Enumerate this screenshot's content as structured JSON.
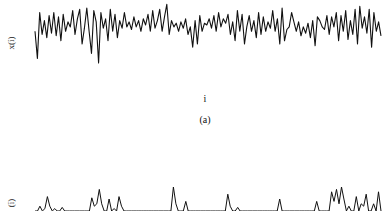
{
  "chart_data": [
    {
      "type": "line",
      "title": "",
      "caption": "(a)",
      "xlabel": "i",
      "ylabel": "x(i)",
      "grid": false,
      "legend": null,
      "note": "Noisy fluctuating time series; no tick labels visible. Values are normalized pixel-estimated amplitudes (0=bottom, 1=top of trace band).",
      "x_range_px": [
        35,
        381
      ],
      "values": [
        0.55,
        0.12,
        0.85,
        0.5,
        0.72,
        0.45,
        0.8,
        0.52,
        0.85,
        0.48,
        0.78,
        0.4,
        0.82,
        0.55,
        0.7,
        0.62,
        0.88,
        0.5,
        0.75,
        0.9,
        0.35,
        0.6,
        0.92,
        0.55,
        0.2,
        0.88,
        0.7,
        0.05,
        0.85,
        0.6,
        0.75,
        0.4,
        0.9,
        0.55,
        0.82,
        0.45,
        0.72,
        0.6,
        0.85,
        0.62,
        0.7,
        0.58,
        0.78,
        0.62,
        0.72,
        0.55,
        0.75,
        0.65,
        0.82,
        0.55,
        0.88,
        0.6,
        0.72,
        0.9,
        0.55,
        0.78,
        0.98,
        0.5,
        0.72,
        0.62,
        0.68,
        0.55,
        0.7,
        0.6,
        0.75,
        0.5,
        0.62,
        0.3,
        0.72,
        0.35,
        0.8,
        0.55,
        0.68,
        0.65,
        0.75,
        0.6,
        0.8,
        0.55,
        0.85,
        0.62,
        0.75,
        0.68,
        0.82,
        0.5,
        0.7,
        0.4,
        0.88,
        0.55,
        0.82,
        0.35,
        0.62,
        0.8,
        0.55,
        0.72,
        0.45,
        0.85,
        0.5,
        0.78,
        0.55,
        0.7,
        0.6,
        0.88,
        0.55,
        0.75,
        0.35,
        0.92,
        0.4,
        0.58,
        0.62,
        0.85,
        0.7,
        0.55,
        0.7,
        0.48,
        0.62,
        0.52,
        0.68,
        0.45,
        0.72,
        0.32,
        0.78,
        0.72,
        0.62,
        0.58,
        0.8,
        0.5,
        0.78,
        0.62,
        0.85,
        0.4,
        0.8,
        0.55,
        0.88,
        0.42,
        0.72,
        0.5,
        0.9,
        0.35,
        0.95,
        0.6,
        0.78,
        0.52,
        0.9,
        0.3,
        0.85,
        0.55,
        0.7,
        0.48
      ]
    },
    {
      "type": "line",
      "title": "",
      "caption": "",
      "xlabel": "",
      "ylabel": "(i)",
      "grid": false,
      "legend": null,
      "note": "Second panel partially cut off at bottom; sparse positive spikes above baseline. Values are normalized spike heights.",
      "x_range_px": [
        35,
        381
      ],
      "values": [
        0,
        0,
        0.2,
        0,
        0.1,
        0.6,
        0.2,
        0,
        0.1,
        0,
        0,
        0.15,
        0,
        0,
        0,
        0,
        0,
        0,
        0,
        0,
        0,
        0,
        0,
        0.55,
        0.2,
        0.3,
        0.9,
        0.3,
        0,
        0,
        0.5,
        0,
        0.1,
        0,
        0.6,
        0.2,
        0,
        0,
        0,
        0,
        0,
        0,
        0,
        0,
        0,
        0,
        0,
        0,
        0,
        0,
        0,
        0,
        0,
        0,
        0,
        0,
        1.0,
        0.3,
        0,
        0,
        0,
        0.4,
        0,
        0,
        0,
        0,
        0,
        0,
        0,
        0,
        0,
        0,
        0,
        0,
        0,
        0,
        0,
        0,
        0.7,
        0.2,
        0,
        0,
        0.15,
        0,
        0,
        0,
        0,
        0,
        0,
        0,
        0,
        0,
        0,
        0,
        0,
        0,
        0,
        0,
        0,
        0.5,
        0,
        0,
        0,
        0,
        0,
        0,
        0,
        0,
        0,
        0,
        0,
        0,
        0,
        0,
        0.4,
        0,
        0,
        0,
        0,
        0,
        0.8,
        0.4,
        0.9,
        0.3,
        1.0,
        0.5,
        0,
        0.2,
        0,
        0,
        0.6,
        0,
        0.3,
        0.2,
        0.7,
        0,
        0,
        0.3,
        0,
        0.8,
        0
      ]
    }
  ]
}
